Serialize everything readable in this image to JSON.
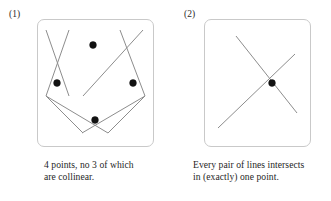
{
  "figure": {
    "background_color": "#ffffff",
    "line_color": "#8d8d8d",
    "dot_color": "#121212",
    "box_border_color": "#c9c9c9",
    "text_color": "#1f1f1f"
  },
  "panels": [
    {
      "label": "(1)",
      "caption": "4 points, no 3 of which\nare collinear.",
      "box": {
        "x": 37,
        "y": 19,
        "width": 117,
        "height": 128,
        "radius": 7
      },
      "points": [
        {
          "name": "top-point",
          "x": 93,
          "y": 45
        },
        {
          "name": "left-point",
          "x": 57,
          "y": 83
        },
        {
          "name": "right-point",
          "x": 133,
          "y": 83
        },
        {
          "name": "bottom-point",
          "x": 95,
          "y": 120
        }
      ],
      "dot_radius": 3.4,
      "lines": [
        {
          "name": "line-top-left",
          "x1": 46,
          "y1": 30,
          "x2": 69,
          "y2": 96
        },
        {
          "name": "line-top-right",
          "x1": 143,
          "y1": 30,
          "x2": 83,
          "y2": 96
        },
        {
          "name": "line-bottom-left",
          "x1": 46,
          "y1": 96,
          "x2": 108,
          "y2": 133
        },
        {
          "name": "line-bottom-right",
          "x1": 145,
          "y1": 96,
          "x2": 82,
          "y2": 133
        },
        {
          "name": "line-upper-left-extension",
          "x1": 69,
          "y1": 30,
          "x2": 46,
          "y2": 96
        },
        {
          "name": "line-upper-right-extension",
          "x1": 120,
          "y1": 30,
          "x2": 145,
          "y2": 96
        },
        {
          "name": "line-lower-left-extension",
          "x1": 83,
          "y1": 133,
          "x2": 46,
          "y2": 96
        },
        {
          "name": "line-lower-right-extension",
          "x1": 108,
          "y1": 133,
          "x2": 145,
          "y2": 96
        }
      ]
    },
    {
      "label": "(2)",
      "caption": "Every pair of lines intersects\nin (exactly) one point.",
      "box": {
        "x": 24,
        "y": 19,
        "width": 107,
        "height": 128,
        "radius": 7
      },
      "points": [
        {
          "name": "intersection-point",
          "x": 92,
          "y": 83
        }
      ],
      "dot_radius": 3.4,
      "lines": [
        {
          "name": "line-a",
          "x1": 56,
          "y1": 36,
          "x2": 117,
          "y2": 113
        },
        {
          "name": "line-b",
          "x1": 115,
          "y1": 54,
          "x2": 38,
          "y2": 128
        }
      ]
    }
  ]
}
